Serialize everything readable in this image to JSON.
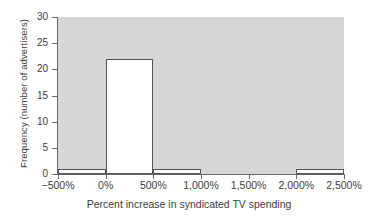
{
  "chart_data": {
    "type": "bar",
    "title": "",
    "xlabel": "Percent increase in syndicated TV spending",
    "ylabel": "Frequency (number of advertisers)",
    "categories": [
      "-500% to 0%",
      "0% to 500%",
      "500% to 1,000%",
      "1,000% to 1,500%",
      "1,500% to 2,000%",
      "2,000% to 2,500%"
    ],
    "values": [
      1,
      22,
      1,
      0,
      0,
      1
    ],
    "bin_edges": [
      -500,
      0,
      500,
      1000,
      1500,
      2000,
      2500
    ],
    "bin_width": 500,
    "xlim": [
      -500,
      2500
    ],
    "ylim": [
      0,
      30
    ],
    "xticks": [
      -500,
      0,
      500,
      1000,
      1500,
      2000,
      2500
    ],
    "xtick_labels": [
      "−500%",
      "0%",
      "500%",
      "1,000%",
      "1,500%",
      "2,000%",
      "2,500%"
    ],
    "yticks": [
      0,
      5,
      10,
      15,
      20,
      25,
      30
    ],
    "ytick_labels": [
      "0",
      "5",
      "10",
      "15",
      "20",
      "25",
      "30"
    ],
    "grid": false,
    "legend": false,
    "colors": {
      "plot_background": "#d6d6d6",
      "bar_fill": "#ffffff",
      "bar_edge": "#555555",
      "axis": "#666666",
      "text": "#3d3d3d",
      "figure_background": "#ffffff"
    }
  }
}
